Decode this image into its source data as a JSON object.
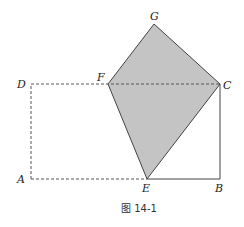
{
  "figure": {
    "caption": "图 14-1",
    "colors": {
      "fill": "#c4c4c4",
      "stroke": "#444444",
      "dashed": "#555555"
    },
    "points": {
      "A": {
        "label": "A"
      },
      "B": {
        "label": "B"
      },
      "C": {
        "label": "C"
      },
      "D": {
        "label": "D"
      },
      "E": {
        "label": "E"
      },
      "F": {
        "label": "F"
      },
      "G": {
        "label": "G"
      }
    }
  }
}
